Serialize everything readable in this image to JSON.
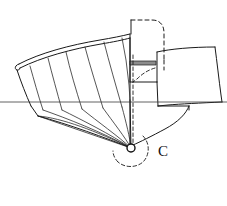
{
  "figure": {
    "kind": "engineering-line-drawing",
    "canvas": {
      "width": 227,
      "height": 206,
      "background": "#ffffff"
    },
    "colors": {
      "line": "#1a1a1a",
      "thin_line": "#2b2b2b",
      "axis": "#3a3a3a",
      "shaded_band": "#8c8c8c",
      "background": "#ffffff",
      "label": "#111111"
    }
  },
  "labels": {
    "center_of_rotation": "C"
  },
  "annotations": {
    "pivot_point": {
      "name": "center-of-rotation",
      "symbol": "C",
      "x": 131,
      "y": 148,
      "radius": 4
    },
    "axis_line": {
      "name": "horizontal-centerline",
      "y": 102,
      "x_start": 0,
      "x_end": 227
    },
    "rotation_arc": {
      "name": "rotation-arc",
      "style": "dashed",
      "center_x": 131,
      "center_y": 148,
      "radius": 18
    }
  },
  "geometry": {
    "blade_rib_count": 6,
    "fan_line_count": 6,
    "hidden_outline_style": "dashed",
    "visible_outline_style": "solid"
  },
  "paths": {
    "blade_upper_edge_outer": "M 19,64 C 40,53 70,45 100,40 C 112,38 122,36 130,34",
    "blade_upper_edge_inner": "M 20,68 C 42,57 72,49 101,44 C 113,42 123,40 130,38",
    "blade_tip_cap": "M 19,64 C 15,65 14,69 17,70 C 18,70.5 19.5,70 20,68",
    "blade_left_flank": "M 17,70 C 21,82 26,95 31,106",
    "blade_lower_left_corner": "M 31,106 L 38,116",
    "blade_fan_hub": "M 38,116 L 131,148",
    "rib_1": "M 30,66 C 34,80 38,95 43,110",
    "rib_2": "M 48,58 C 52,74 57,92 62,110",
    "rib_3": "M 66,52 C 70,70 76,90 82,109",
    "rib_4": "M 85,47 C 90,66 97,88 103,108",
    "rib_5": "M 104,42 C 109,62 116,86 122,107",
    "rib_6": "M 122,38 L 126,60 L 129,85 L 130,100",
    "blade_trailing_vertical": "M 130,34 L 130,100 L 130,146",
    "fan_line_1": "M 38,116 C 62,118 96,131 131,148",
    "fan_line_2": "M 43,110 C 66,118 102,132 131,148",
    "fan_line_3": "M 62,110 C 82,120 110,134 131,148",
    "fan_line_4": "M 82,109 C 98,122 118,136 131,148",
    "fan_line_5": "M 103,108 C 113,122 125,137 131,148",
    "fan_line_6": "M 122,107 C 126,122 130,138 131,148",
    "fan_envelope": "M 38,116 C 68,124 106,138 131,148",
    "hub_vertical_solid": "M 130,100 L 131,148",
    "hub_vertical_dashed": "M 133,55 L 133,100 L 133,143",
    "hidden_box_top": "M 131,20 L 152,20",
    "hidden_box_round": "M 152,20 C 160,20 164,25 164,33 L 164,60",
    "hidden_box_right": "M 164,60 L 164,70",
    "hidden_box_inner_curve": "M 155,68 C 148,70 142,74 137,79 L 133,82",
    "visible_column_left": "M 131,20 L 131,34",
    "visible_column_left_lower": "M 130,38 L 130,82",
    "visible_column_bottom": "M 130,82 L 157,82",
    "visible_column_right": "M 157,82 L 157,52",
    "shaded_band": "M 130,61 L 156,61 L 156,65 L 130,65 Z",
    "right_body_top": "M 157,52 C 170,49 192,47 215,47",
    "right_body_right": "M 215,47 C 217,62 219,80 221,95 L 222,102",
    "right_body_bottom_curve": "M 222,102 C 200,103 180,104 168,105 L 158,106",
    "right_body_left": "M 158,106 L 157,82",
    "lower_right_skirt_top": "M 158,106 L 189,106",
    "lower_right_skirt_curve": "M 189,106 C 186,114 178,122 165,129 C 152,136 140,142 133,145",
    "lower_right_skirt_left": "M 133,145 L 131,148",
    "right_lower_vertical": "M 189,106 L 189,110",
    "arc_rotation": "M 143,136 C 150,143 150,155 143,162 C 136,168 125,168 118,162",
    "arc_tail": "M 118,162 C 115,159 113,155 113,151"
  },
  "text_items": [
    {
      "name": "label-c",
      "value": "C",
      "x": 158,
      "y": 156
    }
  ]
}
